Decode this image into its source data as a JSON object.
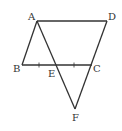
{
  "diagram": {
    "type": "geometry",
    "points": [
      {
        "label": "A",
        "x": 37,
        "y": 21
      },
      {
        "label": "D",
        "x": 107,
        "y": 21
      },
      {
        "label": "B",
        "x": 22,
        "y": 65
      },
      {
        "label": "E",
        "x": 56,
        "y": 65
      },
      {
        "label": "C",
        "x": 92,
        "y": 65
      },
      {
        "label": "F",
        "x": 75,
        "y": 109
      }
    ],
    "segments": [
      [
        "A",
        "D"
      ],
      [
        "A",
        "B"
      ],
      [
        "B",
        "C"
      ],
      [
        "D",
        "F"
      ],
      [
        "A",
        "F"
      ]
    ],
    "tick_marks": [
      "BE",
      "EC"
    ],
    "labels": {
      "A": "A",
      "B": "B",
      "C": "C",
      "D": "D",
      "E": "E",
      "F": "F"
    }
  }
}
